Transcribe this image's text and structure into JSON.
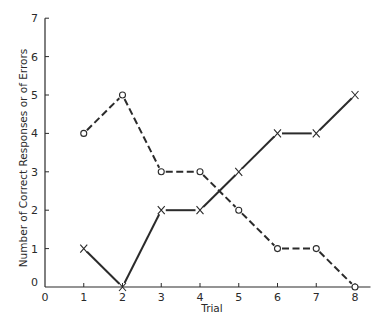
{
  "chart_data": {
    "type": "line",
    "title": "",
    "xlabel": "Trial",
    "ylabel": "Number of Correct Responses or of Errors",
    "x": [
      1,
      2,
      3,
      4,
      5,
      6,
      7,
      8
    ],
    "xticks": [
      "0",
      "1",
      "2",
      "3",
      "4",
      "5",
      "6",
      "7",
      "8"
    ],
    "yticks": [
      "0",
      "1",
      "2",
      "3",
      "4",
      "5",
      "6",
      "7"
    ],
    "xlim": [
      0,
      8.4
    ],
    "ylim": [
      0,
      7
    ],
    "grid": false,
    "legend": null,
    "series": [
      {
        "name": "Errors",
        "marker": "o",
        "linestyle": "dashed",
        "values": [
          4,
          5,
          3,
          3,
          2,
          1,
          1,
          0
        ]
      },
      {
        "name": "Correct Responses",
        "marker": "x",
        "linestyle": "solid",
        "values": [
          1,
          0,
          2,
          2,
          3,
          4,
          4,
          5
        ]
      }
    ]
  }
}
